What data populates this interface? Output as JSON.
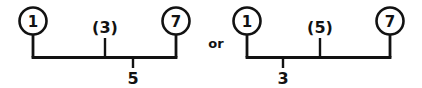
{
  "figure": {
    "kind": "bracket-diagram",
    "ink_color": "#121212",
    "background_color": "#ffffff",
    "conjunction": "or",
    "diagrams": [
      {
        "id": "left",
        "endpoints": [
          {
            "id": "left-start",
            "label": "1",
            "shape": "circle"
          },
          {
            "id": "left-end",
            "label": "7",
            "shape": "circle"
          }
        ],
        "above_label": "(3)",
        "below_label": "5"
      },
      {
        "id": "right",
        "endpoints": [
          {
            "id": "right-start",
            "label": "1",
            "shape": "circle"
          },
          {
            "id": "right-end",
            "label": "7",
            "shape": "circle"
          }
        ],
        "above_label": "(5)",
        "below_label": "3"
      }
    ]
  }
}
